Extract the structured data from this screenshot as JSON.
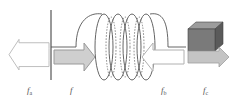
{
  "diagram": {
    "type": "spring-block force diagram",
    "elements": {
      "wall": {
        "color": "#777777"
      },
      "spring": {
        "color": "#555555",
        "turns": 4
      },
      "block": {
        "front": "#7a7a7a",
        "top": "#9a9a9a",
        "side": "#5a5a5a"
      }
    },
    "arrows": [
      {
        "id": "fa",
        "direction": "left",
        "fill": "#ffffff",
        "stroke": "#b0b0b0"
      },
      {
        "id": "f",
        "direction": "right",
        "fill": "#cfcfcf",
        "stroke": "#9a9a9a"
      },
      {
        "id": "fb",
        "direction": "left",
        "fill": "#ffffff",
        "stroke": "#b0b0b0"
      },
      {
        "id": "fc",
        "direction": "right",
        "fill": "#c4c4c4",
        "stroke": "#a0a0a0"
      }
    ],
    "labels": {
      "fa": {
        "main": "f",
        "sub": "a"
      },
      "f": {
        "main": "f",
        "sub": ""
      },
      "fb": {
        "main": "f",
        "sub": "b"
      },
      "fc": {
        "main": "f",
        "sub": "c"
      }
    }
  }
}
